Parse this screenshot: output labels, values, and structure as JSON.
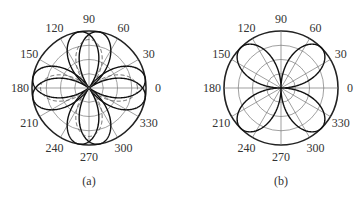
{
  "chart_data": [
    {
      "type": "polar-line",
      "panel_label": "(a)",
      "center_px": [
        89,
        88
      ],
      "radius_px": 57,
      "rings": [
        0.25,
        0.5,
        0.75,
        1.0
      ],
      "angle_ticks": [
        0,
        30,
        60,
        90,
        120,
        150,
        180,
        210,
        240,
        270,
        300,
        330
      ],
      "tick_labels": [
        "0",
        "30",
        "60",
        "90",
        "120",
        "150",
        "180",
        "210",
        "240",
        "270",
        "300",
        "330"
      ],
      "grid": true,
      "series": [
        {
          "name": "solid-rose-1",
          "style": "solid",
          "formula": "r = |cos(2(θ - 10°))|",
          "lobes_deg": [
            10,
            100,
            190,
            280
          ],
          "r_max": 1.0
        },
        {
          "name": "solid-rose-2",
          "style": "solid",
          "formula": "r = |cos(2(θ + 10°))|",
          "lobes_deg": [
            350,
            80,
            170,
            260
          ],
          "r_max": 1.0
        },
        {
          "name": "dashed-rose",
          "style": "dashed",
          "formula": "r = 0.85·|cos(2θ)|",
          "lobes_deg": [
            0,
            90,
            180,
            270
          ],
          "r_max": 0.85
        }
      ]
    },
    {
      "type": "polar-line",
      "panel_label": "(b)",
      "center_px": [
        281,
        88
      ],
      "radius_px": 57,
      "rings": [
        0.25,
        0.5,
        0.75,
        1.0
      ],
      "angle_ticks": [
        0,
        30,
        60,
        90,
        120,
        150,
        180,
        210,
        240,
        270,
        300,
        330
      ],
      "tick_labels": [
        "0",
        "30",
        "60",
        "90",
        "120",
        "150",
        "180",
        "210",
        "240",
        "270",
        "300",
        "330"
      ],
      "grid": true,
      "series": [
        {
          "name": "solid-rose",
          "style": "solid",
          "formula": "r = |sin(2θ)|",
          "lobes_deg": [
            45,
            135,
            225,
            315
          ],
          "r_max": 1.0
        }
      ]
    }
  ],
  "labels": {
    "panel_a": "(a)",
    "panel_b": "(b)"
  }
}
